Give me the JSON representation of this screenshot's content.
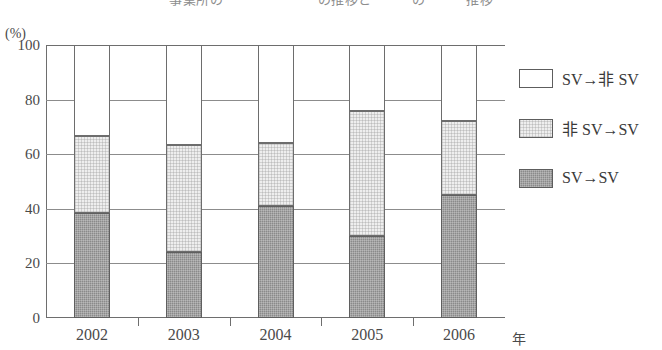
{
  "title_partial": "事業所の　　　　　　　の推移と　　　の　　　推移",
  "axis_unit_top": "(%)",
  "x_unit": "年",
  "legend": {
    "position": "right",
    "items": [
      {
        "label": "SV→非 SV",
        "swatch": "white",
        "color": "#ffffff"
      },
      {
        "label": "非 SV→SV",
        "swatch": "light-gray",
        "color": "#eeeeee"
      },
      {
        "label": "SV→SV",
        "swatch": "dark-gray",
        "color": "#8a8a8a"
      }
    ]
  },
  "y_ticks": [
    "100",
    "80",
    "60",
    "40",
    "20",
    "0"
  ],
  "x_ticks": [
    "2002",
    "2003",
    "2004",
    "2005",
    "2006"
  ],
  "chart_data": {
    "type": "bar",
    "stacked": true,
    "title": "事業所の　　　　　　　の推移と　　　の　　　推移",
    "xlabel": "年",
    "ylabel": "(%)",
    "ylim": [
      0,
      100
    ],
    "y_ticks": [
      0,
      20,
      40,
      60,
      80,
      100
    ],
    "grid": true,
    "legend_position": "right",
    "categories": [
      "2002",
      "2003",
      "2004",
      "2005",
      "2006"
    ],
    "series": [
      {
        "name": "SV→SV",
        "color": "#8a8a8a",
        "values": [
          38.5,
          24.0,
          41.0,
          30.0,
          45.0
        ]
      },
      {
        "name": "非SV→SV",
        "color": "#eeeeee",
        "values": [
          28.0,
          39.5,
          23.0,
          46.0,
          27.0
        ]
      },
      {
        "name": "SV→非SV",
        "color": "#ffffff",
        "values": [
          33.5,
          36.5,
          36.0,
          24.0,
          28.0
        ]
      }
    ],
    "cumulative_tops": {
      "SV→SV": [
        38.5,
        24.0,
        41.0,
        30.0,
        45.0
      ],
      "非SV→SV": [
        66.5,
        63.5,
        64.0,
        76.0,
        72.0
      ],
      "SV→非SV": [
        100,
        100,
        100,
        100,
        100
      ]
    }
  }
}
